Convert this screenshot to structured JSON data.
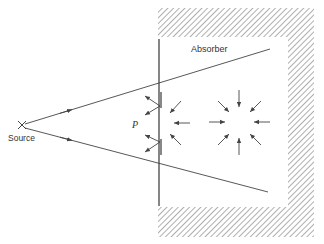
{
  "diagram": {
    "labels": {
      "absorber": "Absorber",
      "point": "P",
      "source": "Source"
    },
    "colors": {
      "line": "#444444",
      "hatch": "#9a9a9a",
      "background": "#ffffff"
    },
    "elements": {
      "source_marker": "×",
      "rays": 2,
      "screen": "vertical line with aperture",
      "outgoing_arrow_pairs_at_P": 2,
      "incoming_arrows_near_screen": 3,
      "converging_arrows_star": 8
    }
  }
}
